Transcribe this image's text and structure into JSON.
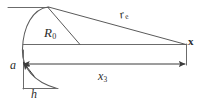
{
  "figure": {
    "type": "geometry-diagram",
    "background_color": "#ffffff",
    "line_color": "#4a4a4a",
    "text_color": "#2b2b2b",
    "labels": {
      "radius": {
        "symbol": "R",
        "subscript": "0"
      },
      "range": {
        "symbol": "r",
        "subscript": "e"
      },
      "field_point": {
        "symbol": "x"
      },
      "axial_distance": {
        "symbol": "x",
        "subscript": "3"
      },
      "aperture": {
        "symbol": "a"
      },
      "height": {
        "symbol": "h"
      }
    },
    "geometry": {
      "apex": {
        "x": 48,
        "y": 7
      },
      "field_point": {
        "x": 186,
        "y": 44
      },
      "arc_left_extent": {
        "x": 22,
        "y": 50
      },
      "arc_bottom": {
        "x": 57,
        "y": 88
      },
      "top_line": {
        "x1": 8,
        "y1": 7,
        "x2": 48,
        "y2": 7
      },
      "mid_line": {
        "x1": 23,
        "y1": 44,
        "x2": 186,
        "y2": 44
      },
      "bottom_line": {
        "x1": 23,
        "y1": 88,
        "x2": 57,
        "y2": 88
      },
      "vertical_line": {
        "x1": 23,
        "y1": 50,
        "x2": 23,
        "y2": 88
      },
      "radius_line": {
        "x1": 48,
        "y1": 7,
        "x2": 80,
        "y2": 44
      },
      "range_line": {
        "x1": 48,
        "y1": 7,
        "x2": 186,
        "y2": 44
      },
      "x3_arrow": {
        "x1": 23,
        "y1": 64,
        "x2": 186,
        "y2": 64
      },
      "a_arrow": {
        "x1": 33,
        "y1": 74,
        "x2": 22,
        "y2": 61
      },
      "right_tick": {
        "x1": 186,
        "y1": 44,
        "x2": 186,
        "y2": 64
      }
    }
  }
}
